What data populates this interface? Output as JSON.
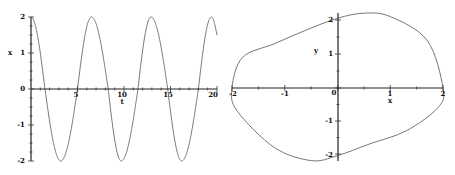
{
  "chart_data": [
    {
      "type": "line",
      "title": "",
      "xlabel": "t",
      "ylabel": "x",
      "xlim": [
        0,
        20
      ],
      "ylim": [
        -2,
        2
      ],
      "x_ticks": [
        "5",
        "10",
        "15",
        "20"
      ],
      "y_ticks": [
        "2",
        "1",
        "0",
        "-1",
        "-2"
      ],
      "grid": false,
      "legend": null,
      "series": [
        {
          "name": "x(t)",
          "description": "oscillation starting at x=2, amplitude ~2, period ~6.4",
          "x": [
            0,
            1.5,
            3.2,
            5.0,
            6.5,
            8.3,
            9.7,
            11.5,
            12.9,
            14.7,
            16.2,
            18.0,
            19.4,
            20
          ],
          "values": [
            2,
            0,
            -2,
            0,
            2,
            0,
            -2,
            0,
            2,
            0,
            -2,
            0,
            2,
            1.5
          ]
        }
      ]
    },
    {
      "type": "line",
      "title": "",
      "xlabel": "x",
      "ylabel": "y",
      "xlim": [
        -2,
        2
      ],
      "ylim": [
        -2.2,
        2.2
      ],
      "x_ticks": [
        "-2",
        "-1",
        "0",
        "1",
        "2"
      ],
      "y_ticks": [
        "2",
        "1",
        "-1",
        "-2"
      ],
      "grid": false,
      "legend": null,
      "series": [
        {
          "name": "phase portrait (limit cycle)",
          "x": [
            2,
            1.7,
            1.0,
            0.5,
            0,
            -0.6,
            -1.2,
            -1.8,
            -2,
            -1.9,
            -1.2,
            -0.5,
            0,
            0.6,
            1.3,
            1.9,
            2
          ],
          "values": [
            0,
            1.4,
            2.1,
            2.2,
            2.05,
            1.7,
            1.3,
            0.9,
            0,
            -0.7,
            -1.8,
            -2.2,
            -2.05,
            -1.7,
            -1.3,
            -0.6,
            0
          ]
        }
      ]
    }
  ]
}
